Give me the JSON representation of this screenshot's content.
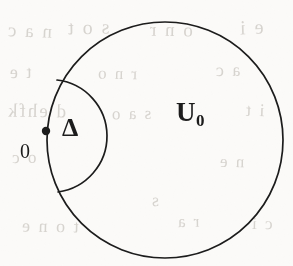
{
  "figure": {
    "kind": "mathematical-diagram",
    "canvas": {
      "width": 293,
      "height": 266
    },
    "background_color": "#fbfaf8",
    "ink_color": "#1c1c1c"
  },
  "labels": {
    "outer_region": {
      "base": "U",
      "subscript": "0",
      "full": "U0"
    },
    "inner_region": {
      "text": "Δ"
    },
    "origin_point": {
      "text": "0"
    }
  },
  "geometry": {
    "outer_circle": {
      "name": "U0",
      "center_x": 165,
      "center_y": 140,
      "radius": 118,
      "stroke_width": 1.7,
      "fill": "none"
    },
    "inner_lens": {
      "name": "Delta",
      "upper_intersection_x": 57,
      "upper_intersection_y": 80,
      "lower_intersection_x": 58,
      "lower_intersection_y": 192,
      "bulge_apex_x": 107,
      "bulge_apex_y": 137,
      "stroke_width": 1.7,
      "fill": "none"
    },
    "origin_dot": {
      "name": "0",
      "center_x": 46,
      "center_y": 131,
      "radius": 4.2,
      "fill": "#1c1c1c"
    }
  },
  "ghost_marks": [
    {
      "text": "n a c",
      "x": 6,
      "y": 20,
      "size": 19,
      "rotate": -2
    },
    {
      "text": "s o t",
      "x": 66,
      "y": 16,
      "size": 20,
      "rotate": 1
    },
    {
      "text": "o n r",
      "x": 148,
      "y": 19,
      "size": 19,
      "rotate": -1
    },
    {
      "text": "e i",
      "x": 238,
      "y": 16,
      "size": 20,
      "rotate": 2
    },
    {
      "text": "t e",
      "x": 8,
      "y": 62,
      "size": 18,
      "rotate": 1
    },
    {
      "text": "r n o",
      "x": 96,
      "y": 64,
      "size": 17,
      "rotate": -1
    },
    {
      "text": "a c",
      "x": 214,
      "y": 60,
      "size": 18,
      "rotate": 1
    },
    {
      "text": "d ehfk",
      "x": 6,
      "y": 100,
      "size": 19,
      "rotate": -1
    },
    {
      "text": "s a o",
      "x": 110,
      "y": 104,
      "size": 17,
      "rotate": 1
    },
    {
      "text": "i t",
      "x": 244,
      "y": 100,
      "size": 18,
      "rotate": -2
    },
    {
      "text": "o c",
      "x": 10,
      "y": 148,
      "size": 17,
      "rotate": 1
    },
    {
      "text": "n e",
      "x": 218,
      "y": 152,
      "size": 17,
      "rotate": -1
    },
    {
      "text": "s",
      "x": 150,
      "y": 190,
      "size": 18,
      "rotate": 1
    },
    {
      "text": "t o n e",
      "x": 20,
      "y": 216,
      "size": 18,
      "rotate": -1
    },
    {
      "text": "r a",
      "x": 176,
      "y": 212,
      "size": 17,
      "rotate": 1
    },
    {
      "text": "c i",
      "x": 250,
      "y": 214,
      "size": 17,
      "rotate": -1
    }
  ]
}
